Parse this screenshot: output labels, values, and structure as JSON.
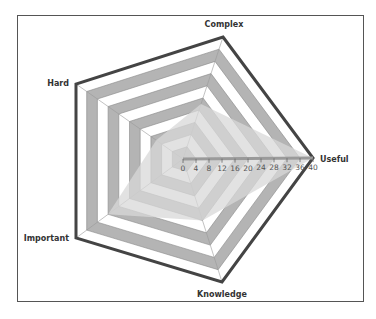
{
  "chart_data": {
    "type": "radar",
    "title": "",
    "axes": [
      "Complex",
      "Useful",
      "Knowledge",
      "Important",
      "Hard"
    ],
    "scale": {
      "min": 0,
      "max": 40,
      "step": 4
    },
    "tick_labels": [
      "0",
      "4",
      "8",
      "12",
      "16",
      "20",
      "24",
      "28",
      "32",
      "36",
      "40"
    ],
    "series": [
      {
        "name": "Series 1",
        "values": [
          18,
          40,
          20,
          28,
          10
        ]
      }
    ],
    "grid": true,
    "legend": "none"
  },
  "colors": {
    "band_dark": "#b4b4b4",
    "band_light": "#ffffff",
    "outline": "#444444",
    "series_fill": "#d8d8d8",
    "axis": "#9a9a9a",
    "frame": "#555555"
  }
}
